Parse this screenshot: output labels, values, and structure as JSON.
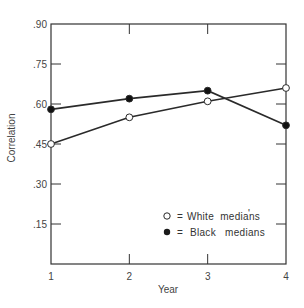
{
  "chart_data": {
    "type": "line",
    "title": "",
    "xlabel": "Year",
    "ylabel": "Correlation",
    "categories": [
      "1",
      "2",
      "3",
      "4"
    ],
    "x": [
      1,
      2,
      3,
      4
    ],
    "xlim": [
      1,
      4
    ],
    "ylim": [
      0,
      0.9
    ],
    "yticks": [
      0.15,
      0.3,
      0.45,
      0.6,
      0.75,
      0.9
    ],
    "ytick_labels": [
      ".15",
      ".30",
      ".45",
      ".60",
      ".75",
      ".90"
    ],
    "grid": false,
    "legend_position": "lower right (inside)",
    "series": [
      {
        "name": "White medians",
        "marker": "open-circle",
        "symbol": "O",
        "values": [
          0.45,
          0.55,
          0.61,
          0.66
        ]
      },
      {
        "name": "Black medians",
        "marker": "filled-circle",
        "symbol": "●",
        "values": [
          0.58,
          0.62,
          0.65,
          0.52
        ]
      }
    ],
    "annotations": [
      "'"
    ]
  },
  "legend": {
    "items": [
      {
        "symbol_desc": "open circle",
        "equals": "=",
        "label": "White medians"
      },
      {
        "symbol_desc": "filled circle",
        "equals": "=",
        "label": "Black medians"
      }
    ],
    "stray_mark": "'"
  },
  "colors": {
    "line": "#2a2a2a",
    "axis": "#333333",
    "text": "#444444",
    "background": "#ffffff"
  }
}
